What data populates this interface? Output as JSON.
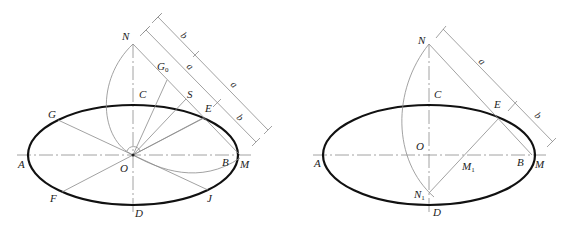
{
  "figures": [
    {
      "id": "left",
      "labels": {
        "N": "N",
        "G0": "G",
        "G0_sub": "0",
        "C": "C",
        "S": "S",
        "E": "E",
        "G": "G",
        "A": "A",
        "O": "O",
        "B": "B",
        "M": "M",
        "F": "F",
        "D": "D",
        "J": "J"
      },
      "dimensions": {
        "outer": [
          "b",
          "a"
        ],
        "inner": [
          "a",
          "b"
        ]
      }
    },
    {
      "id": "right",
      "labels": {
        "N": "N",
        "C": "C",
        "E": "E",
        "A": "A",
        "O": "O",
        "B": "B",
        "M": "M",
        "M1": "M",
        "M1_sub": "1",
        "N1": "N",
        "N1_sub": "1",
        "D": "D"
      },
      "dimensions": {
        "outer": [
          "a",
          "b"
        ]
      }
    }
  ],
  "colors": {
    "ellipse": "#111111",
    "construction": "#8a8a8a",
    "text": "#222222"
  }
}
